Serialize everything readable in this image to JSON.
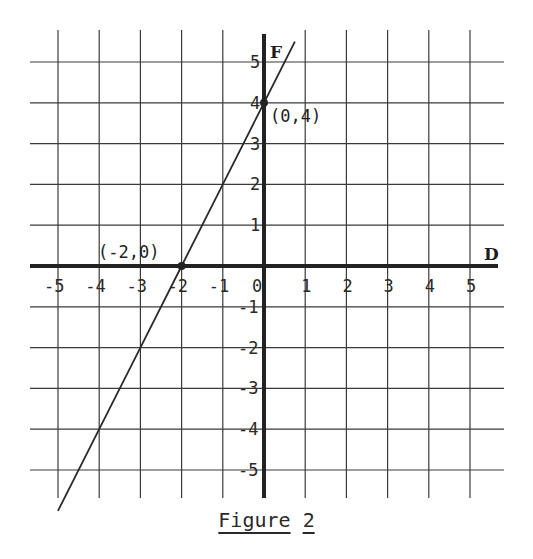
{
  "chart_data": {
    "type": "line",
    "title": "Figure 2",
    "xlabel": "D",
    "ylabel": "F",
    "xlim": [
      -5.5,
      5.5
    ],
    "ylim": [
      -5.6,
      5.6
    ],
    "grid": true,
    "x_ticks": [
      -5,
      -4,
      -3,
      -2,
      -1,
      0,
      1,
      2,
      3,
      4,
      5
    ],
    "y_ticks": [
      -5,
      -4,
      -3,
      -2,
      -1,
      1,
      2,
      3,
      4,
      5
    ],
    "series": [
      {
        "name": "line",
        "equation": "F = 2D + 4",
        "x": [
          -5,
          -4,
          -3,
          -2,
          -1,
          0,
          0.75
        ],
        "y": [
          -6,
          -4,
          -2,
          0,
          2,
          4,
          5.5
        ]
      }
    ],
    "annotations": [
      {
        "text": "(-2,0)",
        "x": -2,
        "y": 0,
        "marker": true
      },
      {
        "text": "(0,4)",
        "x": 0,
        "y": 4,
        "marker": true
      }
    ]
  },
  "figure": {
    "caption_word": "Figure",
    "caption_num": "2",
    "x_axis_label": "D",
    "y_axis_label": "F",
    "point_a_label": "(-2,0)",
    "point_b_label": "(0,4)",
    "line_color": "#2a2a2a",
    "grid_color": "#3a3a3a"
  }
}
